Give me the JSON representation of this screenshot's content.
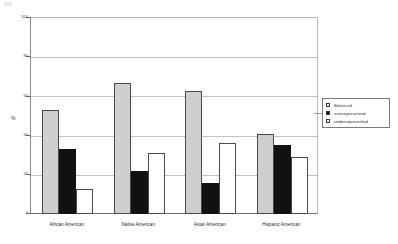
{
  "chart_data": {
    "type": "bar",
    "title": "",
    "xlabel": "",
    "ylabel": "%",
    "ylim": [
      0,
      100
    ],
    "yticks": [
      0,
      20,
      40,
      60,
      80,
      100
    ],
    "grid": true,
    "legend_position": "right",
    "categories": [
      "African American",
      "Native American",
      "Asian American",
      "Hispanic American"
    ],
    "series": [
      {
        "name": "Balanced",
        "color": "#cfcfcf",
        "values": [
          53,
          67,
          63,
          41
        ]
      },
      {
        "name": "overrepresented",
        "color": "#111111",
        "values": [
          33,
          22,
          16,
          35
        ]
      },
      {
        "name": "underrepresented",
        "color": "#ffffff",
        "values": [
          13,
          31,
          36,
          29
        ]
      }
    ]
  },
  "axes": {
    "y_title": "%",
    "y_tick_labels": [
      "100",
      "80",
      "60",
      "40",
      "20",
      "0"
    ]
  },
  "legend": {
    "items": [
      {
        "label": "Balanced"
      },
      {
        "label": "overrepresented"
      },
      {
        "label": "underrepresented"
      }
    ]
  }
}
